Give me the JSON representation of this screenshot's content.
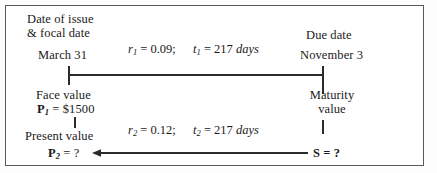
{
  "figure": {
    "title_left_line1": "Date of issue",
    "title_left_line2": "& focal date",
    "title_right": "Due date",
    "start_date": "March 31",
    "end_date": "November 3",
    "border_color": "#5a5a5a",
    "background": "#ffffff",
    "ink_color": "#1a1a1a"
  },
  "timeline_top": {
    "rate_symbol": "r",
    "rate_sub": "1",
    "rate_eq": "=",
    "rate_value": "0.09;",
    "time_symbol": "t",
    "time_sub": "1",
    "time_eq": "=",
    "time_value": "217",
    "time_unit": "days"
  },
  "timeline_bottom": {
    "rate_symbol": "r",
    "rate_sub": "2",
    "rate_eq": "=",
    "rate_value": "0.12;",
    "time_symbol": "t",
    "time_sub": "2",
    "time_eq": "=",
    "time_value": "217",
    "time_unit": "days"
  },
  "left_node": {
    "face_value_label": "Face value",
    "face_value_symbol": "P",
    "face_value_sub": "1",
    "face_value_eq": "=",
    "face_value_amount": "$1500",
    "present_value_label": "Present value",
    "present_value_symbol": "P",
    "present_value_sub": "2",
    "present_value_eq": "=",
    "present_value_amount": "?"
  },
  "right_node": {
    "maturity_label_line1": "Maturity",
    "maturity_label_line2": "value",
    "s_symbol": "S",
    "s_eq": "=",
    "s_value": "?"
  }
}
